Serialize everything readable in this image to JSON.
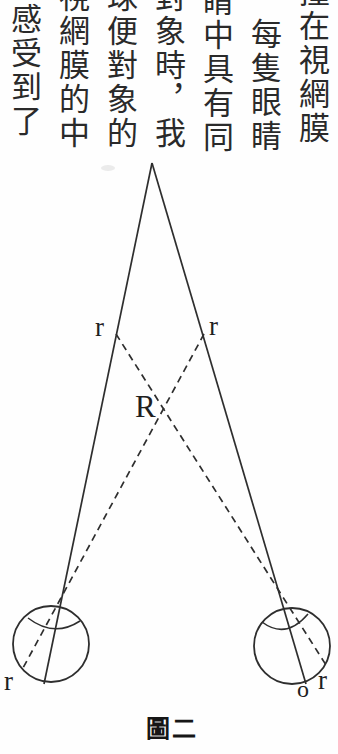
{
  "page": {
    "background": "#fefefe",
    "ink": "#2a2a2a",
    "stroke": "#2e2e2e"
  },
  "text_block": {
    "language": "Traditional Chinese",
    "reading_order": "vertical columns, right to left",
    "columns": [
      {
        "chars": "撞在視網膜",
        "top_char_clipped": true
      },
      {
        "chars": "每隻眼睛",
        "top_char_clipped": false
      },
      {
        "chars": "睛中具有同",
        "top_char_clipped": true
      },
      {
        "chars": "對象時，我",
        "top_char_clipped": true
      },
      {
        "chars": "球便對象的",
        "top_char_clipped": true
      },
      {
        "chars": "視網膜的中",
        "top_char_clipped": true
      },
      {
        "chars": "感受到了",
        "top_char_clipped": false
      }
    ]
  },
  "figure": {
    "caption": "圖二",
    "labels": {
      "r_upper_left": "r",
      "r_upper_right": "r",
      "R_point": "R",
      "r_lower_left": "r",
      "o_point": "o",
      "r_lower_right": "r"
    }
  }
}
